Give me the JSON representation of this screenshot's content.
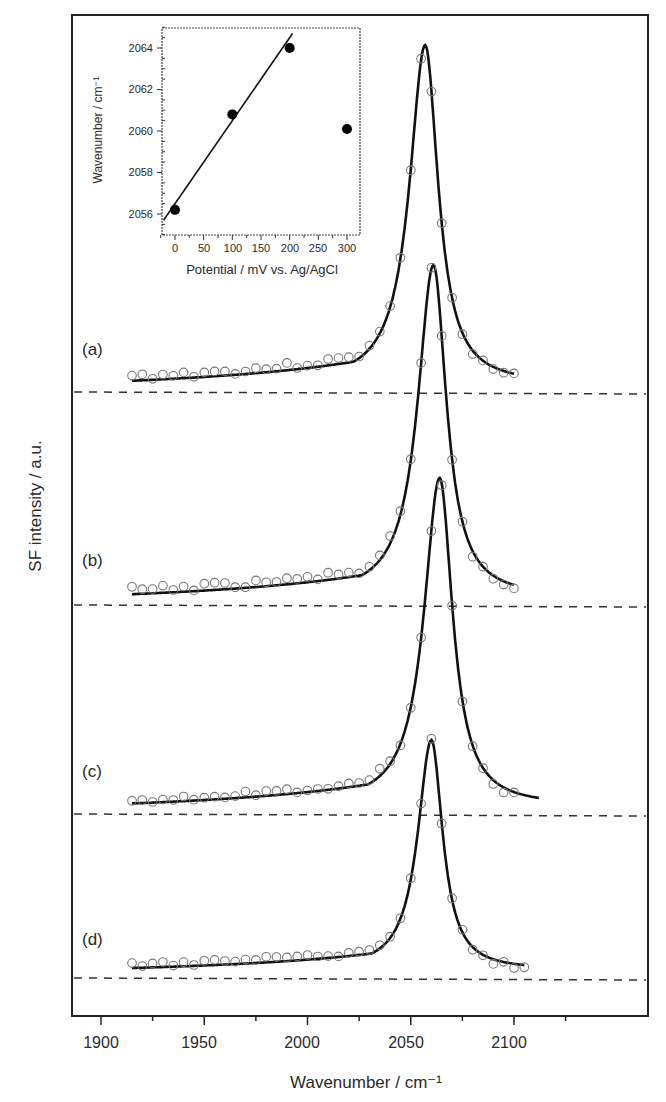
{
  "chart_data": [
    {
      "type": "line",
      "title": "",
      "xlabel": "Wavenumber / cm⁻¹",
      "ylabel": "SF intensity / a.u.",
      "xlim": [
        1885,
        2125
      ],
      "x_ticks": [
        1900,
        1950,
        2000,
        2050,
        2100
      ],
      "y_ticks": [],
      "grid": false,
      "legend": null,
      "notes": "Stacked SFG spectra (open circles = data, solid line = fit), each with dashed zero baseline; traces offset vertically.",
      "series": [
        {
          "name": "(a)",
          "peak_center": 2057,
          "peak_height": 1.0,
          "x_range": [
            1915,
            2100
          ],
          "baseline_offset": 3
        },
        {
          "name": "(b)",
          "peak_center": 2061,
          "peak_height": 1.0,
          "x_range": [
            1915,
            2100
          ],
          "baseline_offset": 2
        },
        {
          "name": "(c)",
          "peak_center": 2064,
          "peak_height": 0.97,
          "x_range": [
            1915,
            2112
          ],
          "baseline_offset": 1
        },
        {
          "name": "(d)",
          "peak_center": 2060,
          "peak_height": 0.69,
          "x_range": [
            1915,
            2105
          ],
          "baseline_offset": 0
        }
      ]
    },
    {
      "type": "scatter",
      "title": "inset",
      "xlabel": "Potential / mV vs. Ag/AgCl",
      "ylabel": "Wavenumber / cm⁻¹",
      "xlim": [
        -25,
        310
      ],
      "ylim": [
        2055,
        2065
      ],
      "x_ticks": [
        0,
        50,
        100,
        150,
        200,
        250,
        300
      ],
      "y_ticks": [
        2056,
        2058,
        2060,
        2062,
        2064
      ],
      "x": [
        0,
        100,
        200,
        300
      ],
      "y": [
        2056.2,
        2060.8,
        2064.0,
        2060.1
      ],
      "fit_line": {
        "x": [
          -20,
          205
        ],
        "y": [
          2055.7,
          2064.7
        ]
      }
    }
  ],
  "labels": {
    "xlabel": "Wavenumber / cm⁻¹",
    "ylabel": "SF intensity / a.u.",
    "x_ticks": [
      "1900",
      "1950",
      "2000",
      "2050",
      "2100"
    ],
    "traces": [
      "(a)",
      "(b)",
      "(c)",
      "(d)"
    ],
    "inset": {
      "xlabel": "Potential / mV vs. Ag/AgCl",
      "ylabel": "Wavenumber / cm⁻¹",
      "x_ticks": [
        "0",
        "50",
        "100",
        "150",
        "200",
        "250",
        "300"
      ],
      "y_ticks": [
        "2064",
        "2062",
        "2060",
        "2058",
        "2056"
      ]
    }
  }
}
